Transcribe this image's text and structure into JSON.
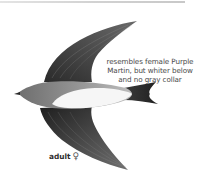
{
  "illustration": {
    "subject": "swallow in flight, ventral view",
    "colors": {
      "wing": "#3a3a3a",
      "wing_light": "#6d6d6d",
      "head": "#8a8a8a",
      "belly": "#f4f4f4",
      "tail": "#2f2f2f",
      "rule": "#d0d0d0"
    }
  },
  "caption": {
    "line1": "resembles female Purple",
    "line2": "Martin, but whiter below",
    "line3": "and no gray collar"
  },
  "label": {
    "age": "adult",
    "sex_symbol": "♀"
  }
}
